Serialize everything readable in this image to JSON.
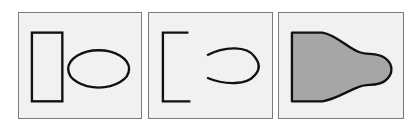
{
  "figure": {
    "panels": [
      {
        "id": "panel-1",
        "description": "separate rectangle and ellipse",
        "shapes": [
          "rectangle",
          "ellipse"
        ]
      },
      {
        "id": "panel-2",
        "description": "open bracket and open arc (partial contours)",
        "shapes": [
          "bracket",
          "arc"
        ]
      },
      {
        "id": "panel-3",
        "description": "merged filled bulb shape",
        "shapes": [
          "merged-shape"
        ]
      }
    ],
    "colors": {
      "background": "#ffffff",
      "panel_fill": "#f1f1f1",
      "panel_border": "#7a7a7a",
      "stroke": "#111111",
      "shape_fill": "#a6a6a6"
    }
  }
}
